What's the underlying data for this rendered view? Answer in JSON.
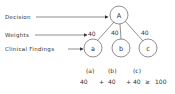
{
  "diagram": {
    "labels": {
      "decision": "Decision",
      "weights": "Weights",
      "findings": "Clinical Findings"
    },
    "root": {
      "id": "A",
      "label": "A"
    },
    "children": [
      {
        "id": "a",
        "label": "a",
        "weight": "40"
      },
      {
        "id": "b",
        "label": "b",
        "weight": "40"
      },
      {
        "id": "c",
        "label": "c",
        "weight": "40"
      }
    ],
    "formula": {
      "headers": [
        "(a)",
        "(b)",
        "(c)"
      ],
      "terms": [
        "40",
        "+",
        "40",
        "+",
        "40",
        "≥",
        "100"
      ]
    }
  }
}
